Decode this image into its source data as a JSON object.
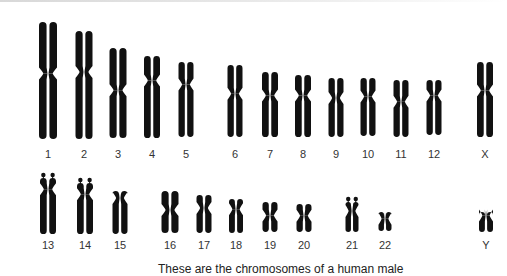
{
  "figure": {
    "caption": "These are the chromosomes of a human male",
    "ink_color": "#111111",
    "label_color": "#333333"
  },
  "chromosomes": [
    {
      "label": "1",
      "x": 48,
      "top": 22,
      "bottom": 139,
      "cen": 0.44,
      "w": 18,
      "row": 1
    },
    {
      "label": "2",
      "x": 84,
      "top": 31,
      "bottom": 139,
      "cen": 0.38,
      "w": 17,
      "row": 1
    },
    {
      "label": "3",
      "x": 118,
      "top": 48,
      "bottom": 138,
      "cen": 0.47,
      "w": 17,
      "row": 1
    },
    {
      "label": "4",
      "x": 152,
      "top": 56,
      "bottom": 138,
      "cen": 0.3,
      "w": 16,
      "row": 1
    },
    {
      "label": "5",
      "x": 186,
      "top": 62,
      "bottom": 137,
      "cen": 0.3,
      "w": 15,
      "row": 1
    },
    {
      "label": "6",
      "x": 235,
      "top": 65,
      "bottom": 137,
      "cen": 0.4,
      "w": 15,
      "row": 1
    },
    {
      "label": "7",
      "x": 270,
      "top": 72,
      "bottom": 137,
      "cen": 0.36,
      "w": 16,
      "row": 1
    },
    {
      "label": "8",
      "x": 303,
      "top": 75,
      "bottom": 137,
      "cen": 0.33,
      "w": 16,
      "row": 1
    },
    {
      "label": "9",
      "x": 336,
      "top": 78,
      "bottom": 137,
      "cen": 0.34,
      "w": 15,
      "row": 1
    },
    {
      "label": "10",
      "x": 368,
      "top": 78,
      "bottom": 136,
      "cen": 0.32,
      "w": 15,
      "row": 1
    },
    {
      "label": "11",
      "x": 401,
      "top": 80,
      "bottom": 137,
      "cen": 0.38,
      "w": 15,
      "row": 1
    },
    {
      "label": "12",
      "x": 434,
      "top": 80,
      "bottom": 135,
      "cen": 0.28,
      "w": 15,
      "row": 1
    },
    {
      "label": "X",
      "x": 485,
      "top": 62,
      "bottom": 137,
      "cen": 0.38,
      "w": 16,
      "row": 1
    },
    {
      "label": "13",
      "x": 48,
      "top": 178,
      "bottom": 234,
      "cen": 0.2,
      "w": 16,
      "row": 2,
      "satellites": true
    },
    {
      "label": "14",
      "x": 85,
      "top": 183,
      "bottom": 234,
      "cen": 0.22,
      "w": 16,
      "row": 2,
      "satellites": true
    },
    {
      "label": "15",
      "x": 120,
      "top": 191,
      "bottom": 234,
      "cen": 0.16,
      "w": 15,
      "row": 2
    },
    {
      "label": "16",
      "x": 170,
      "top": 191,
      "bottom": 233,
      "cen": 0.45,
      "w": 17,
      "row": 2
    },
    {
      "label": "17",
      "x": 204,
      "top": 195,
      "bottom": 233,
      "cen": 0.34,
      "w": 15,
      "row": 2
    },
    {
      "label": "18",
      "x": 236,
      "top": 199,
      "bottom": 233,
      "cen": 0.3,
      "w": 14,
      "row": 2
    },
    {
      "label": "19",
      "x": 270,
      "top": 202,
      "bottom": 232,
      "cen": 0.45,
      "w": 15,
      "row": 2
    },
    {
      "label": "20",
      "x": 304,
      "top": 204,
      "bottom": 232,
      "cen": 0.42,
      "w": 15,
      "row": 2
    },
    {
      "label": "21",
      "x": 352,
      "top": 202,
      "bottom": 232,
      "cen": 0.3,
      "w": 13,
      "row": 2,
      "satellites": true
    },
    {
      "label": "22",
      "x": 385,
      "top": 212,
      "bottom": 231,
      "cen": 0.35,
      "w": 13,
      "row": 2
    },
    {
      "label": "Y",
      "x": 486,
      "top": 212,
      "bottom": 232,
      "cen": 0.18,
      "w": 14,
      "row": 2
    }
  ],
  "label_rows": {
    "1": 148,
    "2": 239
  }
}
